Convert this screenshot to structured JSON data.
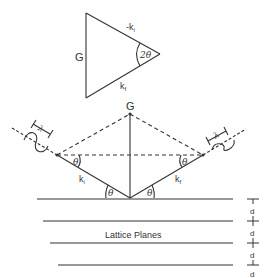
{
  "diagram": {
    "type": "Bragg diffraction geometry",
    "triangle": {
      "side_left": "G",
      "side_top": "-k",
      "side_top_sub": "i",
      "side_bottom": "k",
      "side_bottom_sub": "f",
      "angle": "2θ"
    },
    "scattering": {
      "vector_label": "G",
      "incident_label": "k",
      "incident_sub": "i",
      "final_label": "k",
      "final_sub": "f",
      "angle_theta": "θ",
      "wavelength_left": "λ",
      "wavelength_right": "λ"
    },
    "planes": {
      "label": "Lattice Planes",
      "spacing_labels": [
        "d",
        "d",
        "d",
        "d"
      ]
    },
    "colors": {
      "stroke": "#333333",
      "background": "#ffffff"
    }
  }
}
